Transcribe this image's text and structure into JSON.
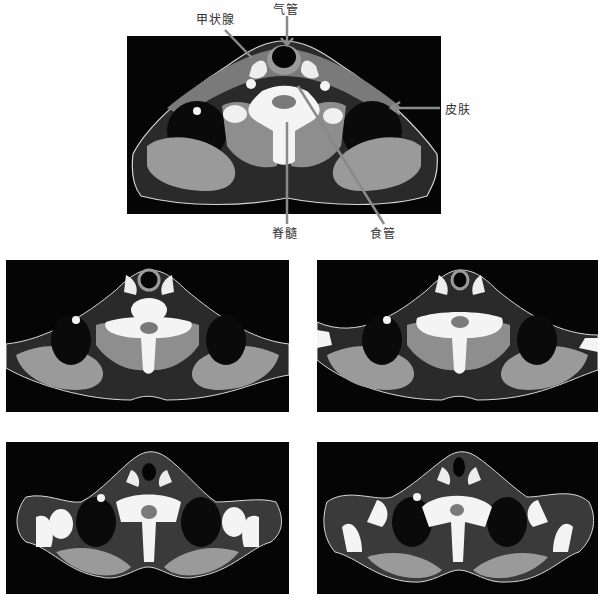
{
  "figure": {
    "panels": [
      {
        "id": "main",
        "description": "Axial CT at thyroid level with skin contour and annotations"
      },
      {
        "id": "row2-left",
        "description": "Axial CT slice"
      },
      {
        "id": "row2-right",
        "description": "Axial CT slice"
      },
      {
        "id": "row3-left",
        "description": "Axial CT slice at shoulder level"
      },
      {
        "id": "row3-right",
        "description": "Axial CT slice at shoulder level"
      }
    ],
    "labels": {
      "thyroid": "甲状腺",
      "trachea": "气管",
      "skin": "皮肤",
      "spinal_cord": "脊髓",
      "esophagus": "食管"
    },
    "colors": {
      "background": "#fefefe",
      "panel_bg": "#050505",
      "arrow": "#8a8a8a",
      "contour": "#d8d8d8",
      "muscle": "#8e8e8e",
      "bone": "#f4f4f4"
    }
  }
}
